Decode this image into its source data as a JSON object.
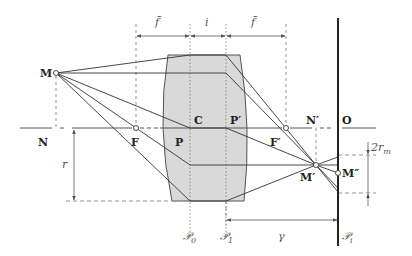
{
  "diagram": {
    "type": "optical-ray-diagram",
    "colors": {
      "lens_fill": "#d9d9d9",
      "lens_edge": "#555555",
      "ray": "#333333",
      "construction": "#666666",
      "screen": "#222222",
      "label_light": "#666666"
    },
    "points": {
      "M": "M",
      "N": "N",
      "F": "F",
      "P": "P",
      "C": "C",
      "P_prime": "P′",
      "F_prime": "F′",
      "N_prime": "N′",
      "O": "O",
      "M_prime": "M′",
      "M_double_prime": "M″"
    },
    "planes": {
      "P0_main": "𝒫",
      "P0_sub": "0",
      "P1_main": "𝒫",
      "P1_sub": "1",
      "Pi_main": "𝒫",
      "Pi_sub": "i"
    },
    "dimensions": {
      "f_left": "f̄",
      "i": "i",
      "f_right": "f̄",
      "r": "r",
      "two_rm_main": "2r",
      "two_rm_sub": "m",
      "gamma": "γ"
    }
  }
}
